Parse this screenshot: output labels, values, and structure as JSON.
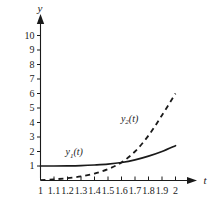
{
  "chart_data": {
    "type": "line",
    "title": "",
    "xlabel": "t",
    "ylabel": "y",
    "xlim": [
      1,
      2
    ],
    "ylim": [
      0,
      11
    ],
    "grid": false,
    "legend": "inline-labels",
    "xticks": [
      "1",
      "1.1",
      "1.2",
      "1.3",
      "1.4",
      "1.5",
      "1.6",
      "1.7",
      "1.8",
      "1.9",
      "2"
    ],
    "xtick_values": [
      1,
      1.1,
      1.2,
      1.3,
      1.4,
      1.5,
      1.6,
      1.7,
      1.8,
      1.9,
      2
    ],
    "yticks": [
      "1",
      "2",
      "3",
      "4",
      "5",
      "6",
      "7",
      "8",
      "9",
      "10"
    ],
    "ytick_values": [
      1,
      2,
      3,
      4,
      5,
      6,
      7,
      8,
      9,
      10
    ],
    "x": [
      1,
      1.1,
      1.2,
      1.3,
      1.4,
      1.5,
      1.6,
      1.7,
      1.8,
      1.9,
      2
    ],
    "series": [
      {
        "name": "y1(t)",
        "label_main": "y",
        "label_sub": "1",
        "label_suffix": "(t)",
        "style": "solid",
        "color": "#1a1a1a",
        "values": [
          1.0,
          1.0,
          1.01,
          1.03,
          1.07,
          1.13,
          1.24,
          1.42,
          1.68,
          2.0,
          2.4
        ],
        "label_x": 1.25,
        "label_y": 1.75
      },
      {
        "name": "y2(t)",
        "label_main": "y",
        "label_sub": "2",
        "label_suffix": "(t)",
        "style": "dashed",
        "color": "#1a1a1a",
        "values": [
          0.02,
          0.08,
          0.16,
          0.28,
          0.48,
          0.78,
          1.25,
          2.0,
          3.1,
          4.5,
          6.0
        ],
        "label_x": 1.66,
        "label_y": 4.05
      }
    ],
    "annotations": [
      {
        "text": "y1(t)",
        "x": 1.25,
        "y": 1.75
      },
      {
        "text": "y2(t)",
        "x": 1.66,
        "y": 4.05
      }
    ]
  },
  "axes": {
    "y_axis_label": "y",
    "x_axis_label": "t"
  }
}
